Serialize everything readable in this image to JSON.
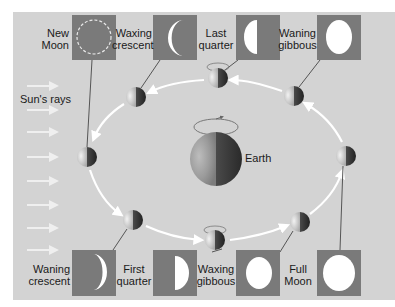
{
  "diagram": {
    "colors": {
      "panel_background": "#d3d3d3",
      "phase_box": "#7a7a7a",
      "lit_moon": "#ffffff",
      "orbit_arrow": "#ffffff",
      "sun_ray": "#f0f0f0",
      "leader_line": "#555555",
      "text": "#1a1a1a"
    },
    "sun_label": "Sun's rays",
    "earth_label": "Earth",
    "top_phases": [
      {
        "id": "new-moon",
        "line1": "New",
        "line2": "Moon",
        "shape": "new"
      },
      {
        "id": "waxing-crescent",
        "line1": "Waxing",
        "line2": "crescent",
        "shape": "crescent-left"
      },
      {
        "id": "last-quarter",
        "line1": "Last",
        "line2": "quarter",
        "shape": "half-left"
      },
      {
        "id": "waning-gibbous",
        "line1": "Waning",
        "line2": "gibbous",
        "shape": "gibbous"
      }
    ],
    "bottom_phases": [
      {
        "id": "waning-crescent",
        "line1": "Waning",
        "line2": "crescent",
        "shape": "crescent-right"
      },
      {
        "id": "first-quarter",
        "line1": "First",
        "line2": "quarter",
        "shape": "half-right"
      },
      {
        "id": "waxing-gibbous",
        "line1": "Waxing",
        "line2": "gibbous",
        "shape": "gibbous"
      },
      {
        "id": "full-moon",
        "line1": "Full",
        "line2": "Moon",
        "shape": "full"
      }
    ],
    "orbit_moon_count": 8,
    "sun_ray_count": 8
  }
}
